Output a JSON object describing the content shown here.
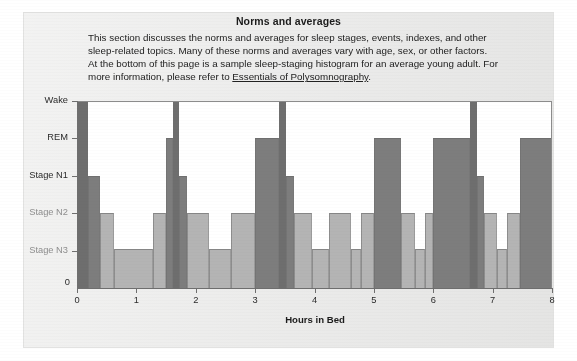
{
  "section": {
    "title": "Norms and averages",
    "body_lines": [
      "This section discusses the norms and averages for sleep stages, events, indexes, and other",
      "sleep-related topics. Many of these norms and averages vary with age, sex, or other factors.",
      "At the bottom of this page is a sample sleep-staging histogram for an average young adult. For",
      "more information, please refer to "
    ],
    "link_text": "Essentials of Polysomnography",
    "body_tail": "."
  },
  "colors": {
    "page_background": "#ffffff",
    "panel_background": "#ececeb",
    "plot_background": "#ffffff",
    "axis": "#6f6f6f",
    "bar_light": "#b4b4b4",
    "bar_dark": "#7d7d7d",
    "bar_darkest": "#6e6e6e",
    "text": "#222222",
    "label_muted": "#8e8e8e"
  },
  "chart_data": {
    "type": "bar",
    "title": "",
    "xlabel": "Hours in Bed",
    "ylabel": "",
    "xlim": [
      0,
      8
    ],
    "xticks": [
      0,
      1,
      2,
      3,
      4,
      5,
      6,
      7,
      8
    ],
    "xticklabels": [
      "0",
      "1",
      "2",
      "3",
      "4",
      "5",
      "6",
      "7",
      "8"
    ],
    "yticks": [
      0,
      1,
      2,
      3,
      4,
      5
    ],
    "yticklabels": [
      "0",
      "Stage N3",
      "Stage N2",
      "Stage N1",
      "REM",
      "Wake"
    ],
    "ylim": [
      0,
      5
    ],
    "grid": false,
    "legend": null,
    "stage_levels": {
      "Wake": 5,
      "REM": 4,
      "Stage N1": 3,
      "Stage N2": 2,
      "Stage N3": 1
    },
    "bars": [
      {
        "start": 0.0,
        "end": 0.18,
        "stage": "Wake",
        "level": 5.0
      },
      {
        "start": 0.18,
        "end": 0.38,
        "stage": "Stage N1",
        "level": 3.0
      },
      {
        "start": 0.38,
        "end": 0.62,
        "stage": "Stage N2",
        "level": 2.0
      },
      {
        "start": 0.62,
        "end": 1.28,
        "stage": "Stage N3",
        "level": 1.05
      },
      {
        "start": 1.28,
        "end": 1.5,
        "stage": "Stage N2",
        "level": 2.0
      },
      {
        "start": 1.5,
        "end": 1.62,
        "stage": "REM",
        "level": 4.0
      },
      {
        "start": 1.62,
        "end": 1.72,
        "stage": "Wake",
        "level": 5.0
      },
      {
        "start": 1.72,
        "end": 1.86,
        "stage": "Stage N1",
        "level": 3.0
      },
      {
        "start": 1.86,
        "end": 2.22,
        "stage": "Stage N2",
        "level": 2.0
      },
      {
        "start": 2.22,
        "end": 2.6,
        "stage": "Stage N3",
        "level": 1.05
      },
      {
        "start": 2.6,
        "end": 3.0,
        "stage": "Stage N2",
        "level": 2.0
      },
      {
        "start": 3.0,
        "end": 3.4,
        "stage": "REM",
        "level": 4.0
      },
      {
        "start": 3.4,
        "end": 3.52,
        "stage": "Wake",
        "level": 5.0
      },
      {
        "start": 3.52,
        "end": 3.66,
        "stage": "Stage N1",
        "level": 3.0
      },
      {
        "start": 3.66,
        "end": 3.96,
        "stage": "Stage N2",
        "level": 2.0
      },
      {
        "start": 3.96,
        "end": 4.24,
        "stage": "Stage N3",
        "level": 1.05
      },
      {
        "start": 4.24,
        "end": 4.62,
        "stage": "Stage N2",
        "level": 2.0
      },
      {
        "start": 4.62,
        "end": 4.78,
        "stage": "Stage N3",
        "level": 1.05
      },
      {
        "start": 4.78,
        "end": 5.0,
        "stage": "Stage N2",
        "level": 2.0
      },
      {
        "start": 5.0,
        "end": 5.46,
        "stage": "REM",
        "level": 4.0
      },
      {
        "start": 5.46,
        "end": 5.7,
        "stage": "Stage N2",
        "level": 2.0
      },
      {
        "start": 5.7,
        "end": 5.86,
        "stage": "Stage N3",
        "level": 1.05
      },
      {
        "start": 5.86,
        "end": 6.0,
        "stage": "Stage N2",
        "level": 2.0
      },
      {
        "start": 6.0,
        "end": 6.62,
        "stage": "REM",
        "level": 4.0
      },
      {
        "start": 6.62,
        "end": 6.74,
        "stage": "Wake",
        "level": 5.0
      },
      {
        "start": 6.74,
        "end": 6.86,
        "stage": "Stage N1",
        "level": 3.0
      },
      {
        "start": 6.86,
        "end": 7.08,
        "stage": "Stage N2",
        "level": 2.0
      },
      {
        "start": 7.08,
        "end": 7.24,
        "stage": "Stage N3",
        "level": 1.05
      },
      {
        "start": 7.24,
        "end": 7.46,
        "stage": "Stage N2",
        "level": 2.0
      },
      {
        "start": 7.46,
        "end": 8.0,
        "stage": "REM",
        "level": 4.0
      }
    ]
  }
}
